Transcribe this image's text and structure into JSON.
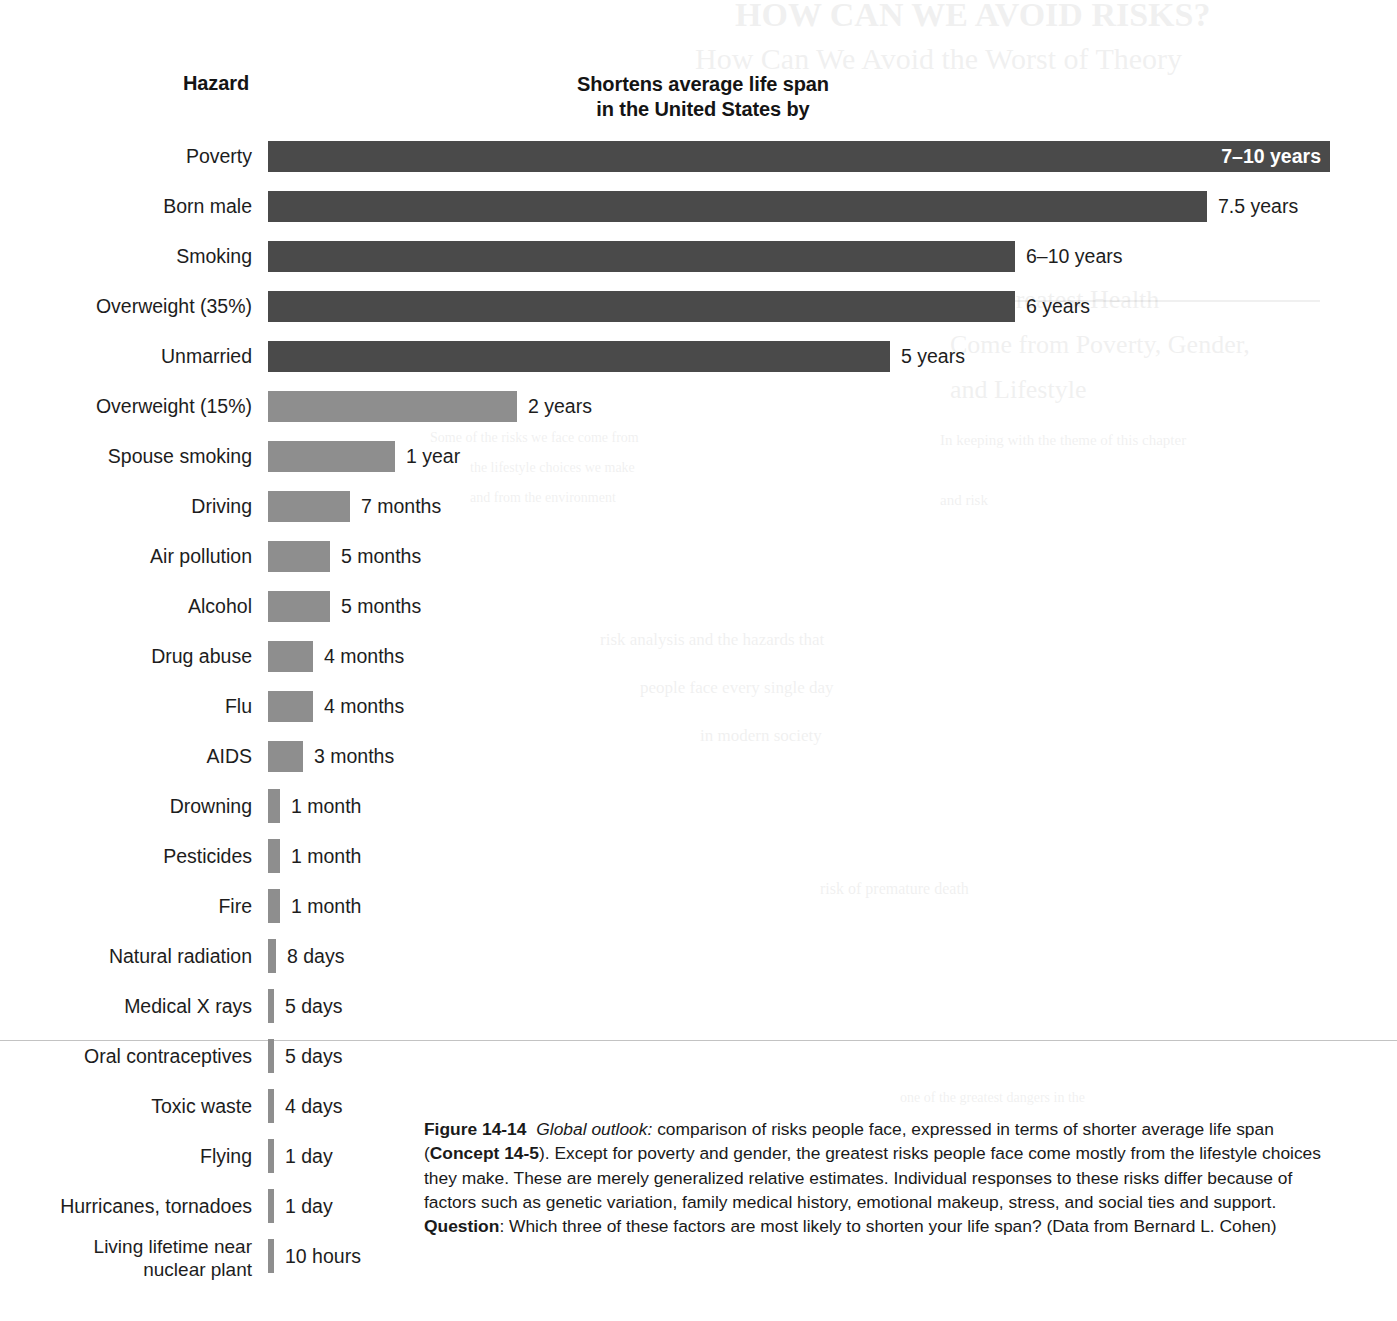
{
  "header": {
    "hazard_label": "Hazard",
    "value_label": "Shortens average life span\nin the United States by"
  },
  "colors": {
    "bar_dark": "#4a4a4a",
    "bar_light": "#8e8e8e",
    "text": "#1a1a1a",
    "page_background": "#ffffff"
  },
  "chart_data": {
    "type": "bar",
    "orientation": "horizontal",
    "title": "Shortens average life span in the United States by",
    "xlabel": "Shortens average life span in the United States by",
    "ylabel": "Hazard",
    "grid": false,
    "legend": "none",
    "units_note": "Bar lengths are relative; values given as text labels",
    "categories": [
      "Poverty",
      "Born male",
      "Smoking",
      "Overweight (35%)",
      "Unmarried",
      "Overweight (15%)",
      "Spouse smoking",
      "Driving",
      "Air pollution",
      "Alcohol",
      "Drug abuse",
      "Flu",
      "AIDS",
      "Drowning",
      "Pesticides",
      "Fire",
      "Natural radiation",
      "Medical X rays",
      "Oral contraceptives",
      "Toxic waste",
      "Flying",
      "Hurricanes, tornadoes",
      "Living lifetime near nuclear plant"
    ],
    "value_labels": [
      "7–10 years",
      "7.5 years",
      "6–10 years",
      "6 years",
      "5 years",
      "2 years",
      "1 year",
      "7 months",
      "5 months",
      "5 months",
      "4 months",
      "4 months",
      "3 months",
      "1 month",
      "1 month",
      "1 month",
      "8 days",
      "5 days",
      "5 days",
      "4 days",
      "1 day",
      "1 day",
      "10 hours"
    ],
    "values_years": [
      8.5,
      7.5,
      8.0,
      6.0,
      5.0,
      2.0,
      1.0,
      0.583,
      0.417,
      0.417,
      0.333,
      0.333,
      0.25,
      0.083,
      0.083,
      0.083,
      0.0219,
      0.0137,
      0.0137,
      0.011,
      0.0027,
      0.0027,
      0.00114
    ]
  },
  "rows": [
    {
      "label": "Poverty",
      "value": "7–10 years",
      "bar_px": 1062,
      "shade": "dark",
      "label_inside": true,
      "two_line": false
    },
    {
      "label": "Born male",
      "value": "7.5 years",
      "bar_px": 939,
      "shade": "dark",
      "label_inside": false,
      "two_line": false
    },
    {
      "label": "Smoking",
      "value": "6–10 years",
      "bar_px": 747,
      "shade": "dark",
      "label_inside": false,
      "two_line": false
    },
    {
      "label": "Overweight (35%)",
      "value": "6 years",
      "bar_px": 747,
      "shade": "dark",
      "label_inside": false,
      "two_line": false
    },
    {
      "label": "Unmarried",
      "value": "5 years",
      "bar_px": 622,
      "shade": "dark",
      "label_inside": false,
      "two_line": false
    },
    {
      "label": "Overweight (15%)",
      "value": "2 years",
      "bar_px": 249,
      "shade": "light",
      "label_inside": false,
      "two_line": false
    },
    {
      "label": "Spouse smoking",
      "value": "1 year",
      "bar_px": 127,
      "shade": "light",
      "label_inside": false,
      "two_line": false
    },
    {
      "label": "Driving",
      "value": "7 months",
      "bar_px": 82,
      "shade": "light",
      "label_inside": false,
      "two_line": false
    },
    {
      "label": "Air pollution",
      "value": "5 months",
      "bar_px": 62,
      "shade": "light",
      "label_inside": false,
      "two_line": false
    },
    {
      "label": "Alcohol",
      "value": "5 months",
      "bar_px": 62,
      "shade": "light",
      "label_inside": false,
      "two_line": false
    },
    {
      "label": "Drug abuse",
      "value": "4 months",
      "bar_px": 45,
      "shade": "light",
      "label_inside": false,
      "two_line": false
    },
    {
      "label": "Flu",
      "value": "4 months",
      "bar_px": 45,
      "shade": "light",
      "label_inside": false,
      "two_line": false
    },
    {
      "label": "AIDS",
      "value": "3 months",
      "bar_px": 35,
      "shade": "light",
      "label_inside": false,
      "two_line": false
    },
    {
      "label": "Drowning",
      "value": "1 month",
      "bar_px": 12,
      "shade": "light",
      "label_inside": false,
      "two_line": false
    },
    {
      "label": "Pesticides",
      "value": "1 month",
      "bar_px": 12,
      "shade": "light",
      "label_inside": false,
      "two_line": false
    },
    {
      "label": "Fire",
      "value": "1 month",
      "bar_px": 12,
      "shade": "light",
      "label_inside": false,
      "two_line": false
    },
    {
      "label": "Natural radiation",
      "value": "8 days",
      "bar_px": 8,
      "shade": "light",
      "label_inside": false,
      "two_line": false
    },
    {
      "label": "Medical X rays",
      "value": "5 days",
      "bar_px": 6,
      "shade": "light",
      "label_inside": false,
      "two_line": false
    },
    {
      "label": "Oral contraceptives",
      "value": "5 days",
      "bar_px": 6,
      "shade": "light",
      "label_inside": false,
      "two_line": false
    },
    {
      "label": "Toxic waste",
      "value": "4 days",
      "bar_px": 6,
      "shade": "light",
      "label_inside": false,
      "two_line": false
    },
    {
      "label": "Flying",
      "value": "1 day",
      "bar_px": 6,
      "shade": "light",
      "label_inside": false,
      "two_line": false
    },
    {
      "label": "Hurricanes, tornadoes",
      "value": "1 day",
      "bar_px": 6,
      "shade": "light",
      "label_inside": false,
      "two_line": false
    },
    {
      "label": "Living lifetime near\nnuclear plant",
      "value": "10 hours",
      "bar_px": 6,
      "shade": "light",
      "label_inside": false,
      "two_line": true
    }
  ],
  "caption": {
    "figure_number": "Figure 14-14",
    "italic_lead": "Global outlook:",
    "text_1": " comparison of risks people face, expressed in terms of shorter average life span (",
    "bold_concept": "Concept 14-5",
    "text_2": "). Except for poverty and gender, the greatest risks people face come mostly from the lifestyle choices they make. These are merely generalized relative estimates. Individual responses to these risks differ because of factors such as genetic variation, family medical history, emotional makeup, stress, and social ties and support. ",
    "bold_question": "Question",
    "text_3": ": Which three of these factors are most likely to shorten your life span? (Data from Bernard L. Cohen)",
    "full_text": "Figure 14-14 Global outlook: comparison of risks people face, expressed in terms of shorter average life span (Concept 14-5). Except for poverty and gender, the greatest risks people face come mostly from the lifestyle choices they make. These are merely generalized relative estimates. Individual responses to these risks differ because of factors such as genetic variation, family medical history, emotional makeup, stress, and social ties and support. Question: Which three of these factors are most likely to shorten your life span? (Data from Bernard L. Cohen)"
  }
}
